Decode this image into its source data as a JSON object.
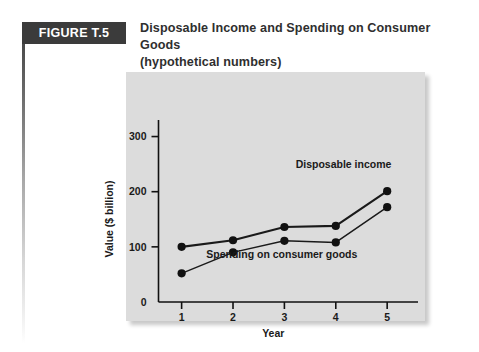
{
  "figure": {
    "tag": "FIGURE T.5",
    "title_line1": "Disposable Income and Spending on Consumer Goods",
    "title_line2": "(hypothetical numbers)"
  },
  "chart_data": {
    "type": "line",
    "title": "Disposable Income and Spending on Consumer Goods (hypothetical numbers)",
    "xlabel": "Year",
    "ylabel": "Value ($ billion)",
    "x": [
      1,
      2,
      3,
      4,
      5
    ],
    "xtick_labels": [
      "1",
      "2",
      "3",
      "4",
      "5"
    ],
    "ytick_labels": [
      "0",
      "100",
      "200",
      "300"
    ],
    "ytick_values": [
      0,
      100,
      200,
      300
    ],
    "ylim": [
      0,
      330
    ],
    "xlim": [
      0.55,
      5.6
    ],
    "grid": false,
    "legend_position": "inline-annotations",
    "plot_background": "#dcdcdc",
    "series": [
      {
        "name": "Disposable income",
        "values": [
          100,
          112,
          136,
          138,
          201
        ],
        "label_x": 4.15,
        "label_y": 243,
        "color": "#1a1a1a",
        "weight": "thick"
      },
      {
        "name": "Spending on consumer goods",
        "values": [
          52,
          90,
          111,
          108,
          172
        ],
        "label_x": 2.95,
        "label_y": 80,
        "color": "#1a1a1a",
        "weight": "thin"
      }
    ]
  }
}
